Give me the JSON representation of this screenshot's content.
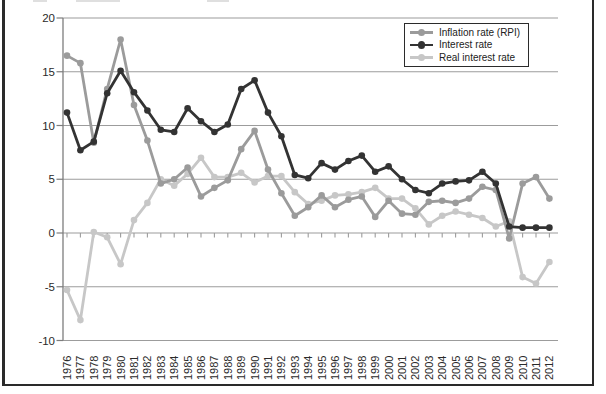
{
  "figure": {
    "kind": "textbook line chart, framed, title cropped off at top"
  },
  "chart_data": {
    "type": "line",
    "title": "",
    "xlabel": "",
    "ylabel": "",
    "x": [
      1976,
      1977,
      1978,
      1979,
      1980,
      1981,
      1982,
      1983,
      1984,
      1985,
      1986,
      1987,
      1988,
      1989,
      1990,
      1991,
      1992,
      1993,
      1994,
      1995,
      1996,
      1997,
      1998,
      1999,
      2000,
      2001,
      2002,
      2003,
      2004,
      2005,
      2006,
      2007,
      2008,
      2009,
      2010,
      2011,
      2012
    ],
    "series": [
      {
        "name": "Inflation rate (RPI)",
        "color": "#9b9b9b",
        "values": [
          16.5,
          15.8,
          8.4,
          13.4,
          18.0,
          11.9,
          8.6,
          4.6,
          5.0,
          6.1,
          3.4,
          4.2,
          4.9,
          7.8,
          9.5,
          5.9,
          3.7,
          1.6,
          2.4,
          3.5,
          2.4,
          3.1,
          3.4,
          1.5,
          3.0,
          1.8,
          1.7,
          2.9,
          3.0,
          2.8,
          3.2,
          4.3,
          4.0,
          -0.5,
          4.6,
          5.2,
          3.2
        ]
      },
      {
        "name": "Interest rate",
        "color": "#333333",
        "values": [
          11.2,
          7.7,
          8.5,
          13.0,
          15.1,
          13.1,
          11.4,
          9.6,
          9.4,
          11.6,
          10.4,
          9.4,
          10.1,
          13.4,
          14.2,
          11.2,
          9.0,
          5.4,
          5.1,
          6.5,
          5.9,
          6.7,
          7.2,
          5.7,
          6.2,
          5.0,
          4.0,
          3.7,
          4.6,
          4.8,
          4.9,
          5.7,
          4.6,
          0.6,
          0.5,
          0.5,
          0.5
        ]
      },
      {
        "name": "Real interest rate",
        "color": "#c7c7c7",
        "values": [
          -5.3,
          -8.1,
          0.1,
          -0.4,
          -2.9,
          1.2,
          2.8,
          5.0,
          4.4,
          5.5,
          7.0,
          5.2,
          5.2,
          5.6,
          4.7,
          5.3,
          5.3,
          3.8,
          2.7,
          3.0,
          3.5,
          3.6,
          3.8,
          4.2,
          3.2,
          3.2,
          2.3,
          0.8,
          1.6,
          2.0,
          1.7,
          1.4,
          0.6,
          1.1,
          -4.1,
          -4.7,
          -2.7
        ]
      }
    ],
    "ylim": [
      -10,
      20
    ],
    "yticks": [
      20,
      15,
      10,
      5,
      0,
      -5,
      -10
    ],
    "grid": true,
    "legend_position": "top-right",
    "colors": {
      "gridline": "#9c9c9c",
      "axis": "#7d7d7d",
      "text": "#2a2a2a",
      "frame": "#2a2a2a",
      "background": "#ffffff"
    }
  }
}
